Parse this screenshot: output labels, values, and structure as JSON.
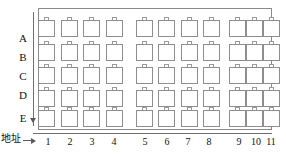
{
  "diagram": {
    "axes": {
      "x_caption": "地址",
      "y_caption": "",
      "x_arrow": "right-arrow",
      "y_arrow": "up-arrow"
    },
    "row_labels": [
      "A",
      "B",
      "C",
      "D",
      "E"
    ],
    "column_labels": [
      "1",
      "2",
      "3",
      "4",
      "5",
      "6",
      "7",
      "8",
      "9",
      "10",
      "11"
    ],
    "column_groups": [
      {
        "name": "group-1",
        "columns": [
          "1",
          "2",
          "3",
          "4"
        ]
      },
      {
        "name": "group-2",
        "columns": [
          "5",
          "6",
          "7",
          "8"
        ]
      },
      {
        "name": "group-3",
        "columns": [
          "9",
          "10",
          "11"
        ]
      }
    ],
    "cell_symbol": "chip-with-top-nub",
    "cells": [
      {
        "row": "A",
        "cells": [
          "A1",
          "A2",
          "A3",
          "A4",
          "A5",
          "A6",
          "A7",
          "A8",
          "A9",
          "A10",
          "A11"
        ]
      },
      {
        "row": "B",
        "cells": [
          "B1",
          "B2",
          "B3",
          "B4",
          "B5",
          "B6",
          "B7",
          "B8",
          "B9",
          "B10",
          "B11"
        ]
      },
      {
        "row": "C",
        "cells": [
          "C1",
          "C2",
          "C3",
          "C4",
          "C5",
          "C6",
          "C7",
          "C8",
          "C9",
          "C10",
          "C11"
        ]
      },
      {
        "row": "D",
        "cells": [
          "D1",
          "D2",
          "D3",
          "D4",
          "D5",
          "D6",
          "D7",
          "D8",
          "D9",
          "D10",
          "D11"
        ]
      },
      {
        "row": "E",
        "cells": [
          "E1",
          "E2",
          "E3",
          "E4",
          "E5",
          "E6",
          "E7",
          "E8",
          "E9",
          "E10",
          "E11"
        ]
      }
    ],
    "colors": {
      "cell_stroke": "#8e8e8e",
      "frame_stroke": "#8a8a8a",
      "axis_stroke": "#6f6f6f",
      "text": "#121212",
      "background": "#ffffff"
    },
    "geometry": {
      "row_y": [
        20,
        44,
        67,
        90,
        110
      ],
      "col_x": [
        47,
        70,
        92,
        115,
        145,
        167,
        190,
        212,
        238,
        255,
        272
      ],
      "col_label_x": [
        48,
        70,
        92,
        114,
        145,
        167,
        188,
        209,
        239,
        256,
        271
      ],
      "row_label_y": [
        33,
        52,
        71,
        90,
        113
      ]
    }
  }
}
